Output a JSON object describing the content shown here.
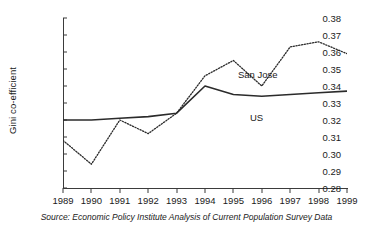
{
  "chart_data": {
    "type": "line",
    "title": "",
    "xlabel": "",
    "ylabel": "Gini co-efficient",
    "x": [
      1989,
      1990,
      1991,
      1992,
      1993,
      1994,
      1995,
      1996,
      1997,
      1998,
      1999
    ],
    "xtick_labels": [
      "1989",
      "1990",
      "1991",
      "1992",
      "1993",
      "1994",
      "1995",
      "1996",
      "1997",
      "1998",
      "1999"
    ],
    "ytick_labels": [
      "0.38",
      "0.37",
      "0.36",
      "0.35",
      "0.34",
      "0.33",
      "0.32",
      "0.31",
      "0.30",
      "0.29",
      "0.28"
    ],
    "ytick_values": [
      0.38,
      0.37,
      0.36,
      0.35,
      0.34,
      0.33,
      0.32,
      0.31,
      0.3,
      0.29,
      0.28
    ],
    "ylim": [
      0.28,
      0.38
    ],
    "xlim": [
      1989,
      1999
    ],
    "grid": false,
    "legend_position": "inline-annotations",
    "series": [
      {
        "name": "San Jose",
        "style": "dotted",
        "color": "#2b2b2b",
        "values": [
          0.308,
          0.294,
          0.32,
          0.312,
          0.324,
          0.346,
          0.355,
          0.34,
          0.363,
          0.366,
          0.359
        ]
      },
      {
        "name": "US",
        "style": "solid",
        "color": "#2b2b2b",
        "values": [
          0.32,
          0.32,
          0.321,
          0.322,
          0.324,
          0.34,
          0.335,
          0.334,
          0.335,
          0.336,
          0.337
        ]
      }
    ],
    "annotations": [
      {
        "text": "San Jose",
        "series": "San Jose"
      },
      {
        "text": "US",
        "series": "US"
      }
    ],
    "source_note": "Source: Economic Policy Institute Analysis of Current Population Survey Data"
  }
}
